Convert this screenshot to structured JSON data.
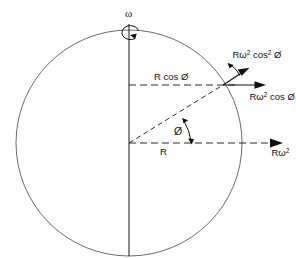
{
  "figure": {
    "background_color": "#ffffff",
    "line_color": "#111111",
    "circle_color": "#5a5a5a",
    "width": 296,
    "height": 258
  },
  "labels": {
    "omega": "ω",
    "angle_phi": "Ø",
    "radius": "R",
    "r_cos_phi": "R cos Ø",
    "r_omega_sq": {
      "base": "Rω",
      "exp": "2"
    },
    "r_omega_sq_cos_phi": {
      "base1": "Rω",
      "exp1": "2",
      "base2": " cos Ø"
    },
    "r_omega_sq_cos_sq_phi": {
      "base1": "Rω",
      "exp1": "2",
      "base2": " cos",
      "exp2": "2",
      "base3": " Ø"
    }
  },
  "geometry": {
    "center_x": 129,
    "center_y": 143,
    "radius": 113,
    "point_angle_deg": 30,
    "point_x": 223,
    "point_y": 85
  },
  "elements": {
    "circle_name": "rotating-sphere-outline",
    "axis_name": "rotation-axis",
    "radius_name": "radius-line",
    "equator_name": "equatorial-dashed-line",
    "latitude_name": "latitude-dashed-line"
  }
}
